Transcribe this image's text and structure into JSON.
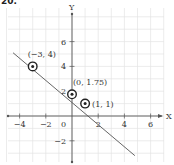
{
  "problem_number": "20.",
  "chart_data": {
    "type": "line",
    "title": "",
    "xlabel": "X",
    "ylabel": "Y",
    "xlim": [
      -5,
      7
    ],
    "ylim": [
      -3.5,
      8
    ],
    "grid": true,
    "x_ticks": [
      -4,
      -2,
      2,
      4,
      6
    ],
    "y_ticks": [
      -2,
      2,
      4,
      6
    ],
    "origin_label": "0",
    "line": {
      "x": [
        -4.5,
        4.8
      ],
      "y": [
        5.1,
        -3.2
      ]
    },
    "points": [
      {
        "x": -3,
        "y": 4,
        "label": "(−3, 4)"
      },
      {
        "x": 0,
        "y": 1.75,
        "label": "(0, 1.75)"
      },
      {
        "x": 1,
        "y": 1,
        "label": "(1, 1)"
      }
    ]
  },
  "colors": {
    "grid": "#e4e4e4",
    "axis": "#555555",
    "line": "#555555",
    "point": "#222222"
  }
}
